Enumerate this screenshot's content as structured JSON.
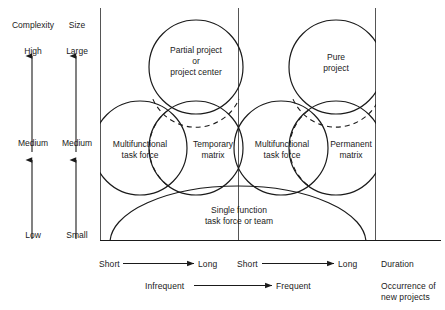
{
  "diagram": {
    "left_axes": [
      {
        "name": "complexity",
        "header": "Complexity",
        "top": "High",
        "middle": "Medium",
        "bottom": "Low"
      },
      {
        "name": "size",
        "header": "Size",
        "top": "Large",
        "middle": "Medium",
        "bottom": "Small"
      }
    ],
    "regions": [
      {
        "key": "partial_project",
        "label": "Partial project\nor\nproject center"
      },
      {
        "key": "pure_project",
        "label": "Pure\nproject"
      },
      {
        "key": "multifunctional_task_force_left",
        "label": "Multifunctional\ntask force"
      },
      {
        "key": "temporary_matrix",
        "label": "Temporary\nmatrix"
      },
      {
        "key": "multifunctional_task_force_right",
        "label": "Multifunctional\ntask force"
      },
      {
        "key": "permanent_matrix",
        "label": "Permanent\nmatrix"
      },
      {
        "key": "single_function",
        "label": "Single function\ntask force or team"
      }
    ],
    "bottom_axes": {
      "duration": {
        "caption": "Duration",
        "left_segment": {
          "start": "Short",
          "end": "Long"
        },
        "right_segment": {
          "start": "Short",
          "end": "Long"
        }
      },
      "occurrence": {
        "caption": "Occurrence of\nnew projects",
        "start": "Infrequent",
        "end": "Frequent"
      }
    },
    "colors": {
      "stroke": "#1a1a1a",
      "background": "#ffffff",
      "text": "#1a1a1a"
    }
  }
}
